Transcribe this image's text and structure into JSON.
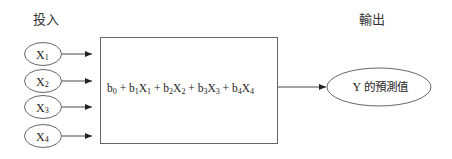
{
  "diagram": {
    "type": "regression-model-flow",
    "input_header": "投入",
    "output_header": "輸出",
    "inputs": [
      {
        "base": "X",
        "sub": "1"
      },
      {
        "base": "X",
        "sub": "2"
      },
      {
        "base": "X",
        "sub": "3"
      },
      {
        "base": "X",
        "sub": "4"
      }
    ],
    "model": {
      "terms": [
        {
          "coef": "b",
          "coef_sub": "0",
          "var": "",
          "var_sub": ""
        },
        {
          "coef": "b",
          "coef_sub": "1",
          "var": "X",
          "var_sub": "1"
        },
        {
          "coef": "b",
          "coef_sub": "2",
          "var": "X",
          "var_sub": "2"
        },
        {
          "coef": "b",
          "coef_sub": "3",
          "var": "X",
          "var_sub": "3"
        },
        {
          "coef": "b",
          "coef_sub": "4",
          "var": "X",
          "var_sub": "4"
        }
      ],
      "operator": "+"
    },
    "output": {
      "y": "Y",
      "label": "的預測值"
    },
    "colors": {
      "stroke": "#555555",
      "arrow": "#222222",
      "text": "#222222",
      "background": "#ffffff"
    }
  }
}
